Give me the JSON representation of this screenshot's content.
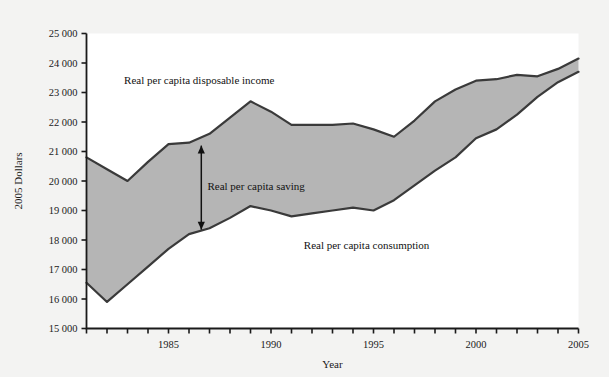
{
  "chart_data": {
    "type": "area",
    "title": "",
    "xlabel": "Year",
    "ylabel": "2005 Dollars",
    "xlim": [
      1981,
      2005
    ],
    "ylim": [
      15000,
      25000
    ],
    "ytick_step": 1000,
    "xtick_step": 1,
    "grid": false,
    "legend_position": "inline-annotations",
    "x": [
      1981,
      1982,
      1983,
      1984,
      1985,
      1986,
      1987,
      1988,
      1989,
      1990,
      1991,
      1992,
      1993,
      1994,
      1995,
      1996,
      1997,
      1998,
      1999,
      2000,
      2001,
      2002,
      2003,
      2004,
      2005
    ],
    "xtick_labels": [
      "",
      "",
      "",
      "",
      "1985",
      "",
      "",
      "",
      "",
      "1990",
      "",
      "",
      "",
      "",
      "1995",
      "",
      "",
      "",
      "",
      "2000",
      "",
      "",
      "",
      "",
      "2005"
    ],
    "ytick_labels": [
      "15 000",
      "16 000",
      "17 000",
      "18 000",
      "19 000",
      "20 000",
      "21 000",
      "22 000",
      "23 000",
      "24 000",
      "25 000"
    ],
    "ytick_values": [
      15000,
      16000,
      17000,
      18000,
      19000,
      20000,
      21000,
      22000,
      23000,
      24000,
      25000
    ],
    "series": [
      {
        "name": "Real per capita disposable income",
        "values": [
          20800,
          20400,
          20000,
          20650,
          21250,
          21300,
          21600,
          22150,
          22700,
          22350,
          21900,
          21900,
          21900,
          21950,
          21750,
          21500,
          22050,
          22700,
          23100,
          23400,
          23450,
          23600,
          23550,
          23800,
          24150
        ]
      },
      {
        "name": "Real per capita consumption",
        "values": [
          16550,
          15900,
          16500,
          17100,
          17700,
          18200,
          18400,
          18750,
          19150,
          19000,
          18800,
          18900,
          19000,
          19100,
          19000,
          19350,
          19850,
          20350,
          20800,
          21450,
          21750,
          22250,
          22850,
          23350,
          23700
        ]
      }
    ],
    "annotations": [
      {
        "text": "Real per capita disposable income",
        "x": 1986.5,
        "y": 23300
      },
      {
        "text": "Real per capita saving",
        "x": 1986.9,
        "y": 19700
      },
      {
        "text": "Real per capita consumption",
        "x": 1991.6,
        "y": 17700
      }
    ],
    "gap_arrow": {
      "name": "saving-gap-arrow",
      "x": 1986.6,
      "y_top": 21200,
      "y_bottom": 18350
    },
    "colors": {
      "fill": "#b5b5b5",
      "line": "#3a3a3a",
      "axis": "#1a1a1a",
      "text": "#1a1a1a",
      "background": "#f3f3f2",
      "plot_background": "#ffffff"
    }
  }
}
